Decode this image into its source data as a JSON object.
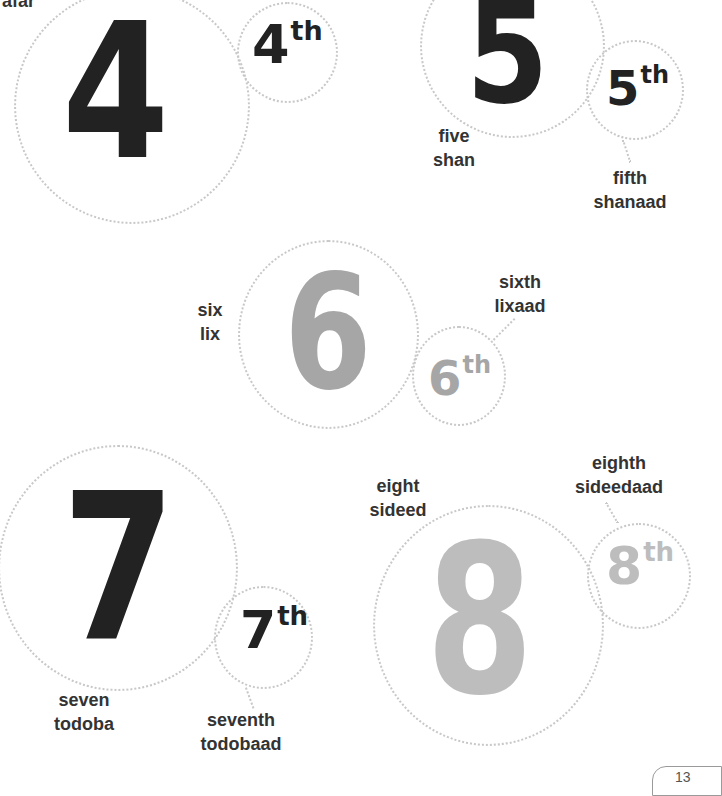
{
  "page": {
    "background": "#ffffff",
    "circle_border_color": "#c8c8c8",
    "colors": {
      "dark": "#222222",
      "mid_gray": "#a6a6a6",
      "light_gray": "#bdbdbd",
      "label": "#333333"
    }
  },
  "numbers": [
    {
      "digit": "4",
      "ordinal_digit": "4",
      "ordinal_suffix": "th",
      "cardinal_label": {
        "english": "",
        "somali": "afar"
      },
      "ordinal_label": {
        "english": "",
        "somali": ""
      },
      "color": "dark"
    },
    {
      "digit": "5",
      "ordinal_digit": "5",
      "ordinal_suffix": "th",
      "cardinal_label": {
        "english": "five",
        "somali": "shan"
      },
      "ordinal_label": {
        "english": "fifth",
        "somali": "shanaad"
      },
      "color": "dark"
    },
    {
      "digit": "6",
      "ordinal_digit": "6",
      "ordinal_suffix": "th",
      "cardinal_label": {
        "english": "six",
        "somali": "lix"
      },
      "ordinal_label": {
        "english": "sixth",
        "somali": "lixaad"
      },
      "color": "mid_gray"
    },
    {
      "digit": "7",
      "ordinal_digit": "7",
      "ordinal_suffix": "th",
      "cardinal_label": {
        "english": "seven",
        "somali": "todoba"
      },
      "ordinal_label": {
        "english": "seventh",
        "somali": "todobaad"
      },
      "color": "dark"
    },
    {
      "digit": "8",
      "ordinal_digit": "8",
      "ordinal_suffix": "th",
      "cardinal_label": {
        "english": "eight",
        "somali": "sideed"
      },
      "ordinal_label": {
        "english": "eighth",
        "somali": "sideedaad"
      },
      "color": "light_gray"
    }
  ],
  "page_tab": {
    "number": "13"
  }
}
